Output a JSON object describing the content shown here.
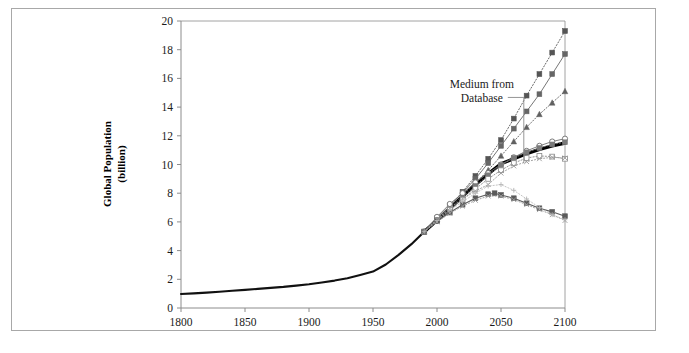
{
  "figure": {
    "background_color": "#ffffff",
    "frame_color": "#a8a8a8"
  },
  "annotation": {
    "line1": "Medium from",
    "line2": "Database"
  },
  "chart_data": {
    "type": "line",
    "title": "",
    "xlabel": "",
    "ylabel": "Global Population\n(billion)",
    "ylabel_line1": "Global Population",
    "ylabel_line2": "(billion)",
    "xlim": [
      1800,
      2100
    ],
    "ylim": [
      0,
      20
    ],
    "xticks": [
      1800,
      1850,
      1900,
      1950,
      2000,
      2050,
      2100
    ],
    "yticks": [
      0,
      2,
      4,
      6,
      8,
      10,
      12,
      14,
      16,
      18,
      20
    ],
    "xtick_labels": [
      "1800",
      "1850",
      "1900",
      "1950",
      "2000",
      "2050",
      "2100"
    ],
    "ytick_labels": [
      "0",
      "2",
      "4",
      "6",
      "8",
      "10",
      "12",
      "14",
      "16",
      "18",
      "20"
    ],
    "grid": false,
    "legend": "none",
    "annotations": [
      {
        "text": "Medium from Database",
        "x": 2035,
        "y": 15.3,
        "leader_to_x": 2046,
        "leader_to_y": 10.1
      }
    ],
    "series": [
      {
        "name": "Historical",
        "marker": "none",
        "linestyle": "solid",
        "color": "#111111",
        "width": 2.1,
        "x": [
          1800,
          1810,
          1820,
          1830,
          1840,
          1850,
          1860,
          1870,
          1880,
          1890,
          1900,
          1910,
          1920,
          1930,
          1940,
          1950,
          1960,
          1970,
          1980,
          1990
        ],
        "y": [
          0.98,
          1.02,
          1.07,
          1.13,
          1.2,
          1.26,
          1.33,
          1.4,
          1.47,
          1.56,
          1.65,
          1.78,
          1.91,
          2.07,
          2.3,
          2.54,
          3.03,
          3.7,
          4.45,
          5.32
        ]
      },
      {
        "name": "Medium from Database",
        "marker": "none",
        "linestyle": "solid",
        "color": "#000000",
        "width": 3.4,
        "x": [
          1990,
          2000,
          2010,
          2020,
          2030,
          2040,
          2050,
          2060,
          2070,
          2080,
          2090,
          2100
        ],
        "y": [
          5.32,
          6.12,
          6.93,
          7.79,
          8.6,
          9.35,
          10.05,
          10.4,
          10.75,
          11.05,
          11.3,
          11.5
        ]
      },
      {
        "name": "High scenario A (squares, dotted)",
        "marker": "square",
        "linestyle": "dotted",
        "color": "#555555",
        "width": 0.9,
        "x": [
          1990,
          2000,
          2010,
          2020,
          2030,
          2040,
          2050,
          2060,
          2070,
          2080,
          2090,
          2100
        ],
        "y": [
          5.32,
          6.2,
          7.1,
          8.1,
          9.2,
          10.4,
          11.7,
          13.2,
          14.8,
          16.3,
          17.8,
          19.3
        ]
      },
      {
        "name": "High scenario B (squares, solid)",
        "marker": "square",
        "linestyle": "solid",
        "color": "#666666",
        "width": 0.9,
        "x": [
          1990,
          2000,
          2010,
          2020,
          2030,
          2040,
          2050,
          2060,
          2070,
          2080,
          2090,
          2100
        ],
        "y": [
          5.32,
          6.25,
          7.1,
          8.05,
          9.0,
          10.1,
          11.3,
          12.5,
          13.7,
          14.9,
          16.3,
          17.7
        ]
      },
      {
        "name": "High scenario C (triangles, dotted)",
        "marker": "triangle",
        "linestyle": "dotted",
        "color": "#606060",
        "width": 0.9,
        "x": [
          1990,
          2000,
          2010,
          2020,
          2030,
          2040,
          2050,
          2060,
          2070,
          2080,
          2090,
          2100
        ],
        "y": [
          5.32,
          6.2,
          7.0,
          7.85,
          8.7,
          9.6,
          10.6,
          11.6,
          12.6,
          13.5,
          14.3,
          15.1
        ]
      },
      {
        "name": "Medium scenario D (open circles, solid)",
        "marker": "circle-open",
        "linestyle": "solid",
        "color": "#6e6e6e",
        "width": 0.9,
        "x": [
          1990,
          2000,
          2010,
          2020,
          2030,
          2040,
          2050,
          2060,
          2070,
          2080,
          2090,
          2100
        ],
        "y": [
          5.32,
          6.35,
          7.25,
          8.0,
          8.75,
          9.4,
          10.0,
          10.5,
          10.95,
          11.3,
          11.6,
          11.8
        ]
      },
      {
        "name": "Medium scenario E (squares, dotted)",
        "marker": "square",
        "linestyle": "dotted",
        "color": "#7a7a7a",
        "width": 0.9,
        "x": [
          1990,
          2000,
          2010,
          2020,
          2030,
          2040,
          2050,
          2060,
          2070,
          2080,
          2090,
          2100
        ],
        "y": [
          5.32,
          6.15,
          6.9,
          7.7,
          8.5,
          9.25,
          9.95,
          10.45,
          10.85,
          11.15,
          11.4,
          11.55
        ]
      },
      {
        "name": "Medium scenario F (open squares, dotted)",
        "marker": "square-open",
        "linestyle": "dotted",
        "color": "#888888",
        "width": 0.9,
        "x": [
          1990,
          2000,
          2010,
          2020,
          2030,
          2040,
          2050,
          2060,
          2070,
          2080,
          2090,
          2100
        ],
        "y": [
          5.32,
          6.1,
          6.85,
          7.55,
          8.3,
          9.0,
          9.6,
          10.1,
          10.45,
          10.6,
          10.55,
          10.4
        ]
      },
      {
        "name": "Low-medium scenario G (crosses, dotted)",
        "marker": "x",
        "linestyle": "dotted",
        "color": "#9a9a9a",
        "width": 0.9,
        "x": [
          1990,
          2000,
          2010,
          2020,
          2030,
          2040,
          2050,
          2060,
          2070,
          2080,
          2090,
          2100
        ],
        "y": [
          5.32,
          6.2,
          6.95,
          7.6,
          8.15,
          8.6,
          9.4,
          9.9,
          10.2,
          10.4,
          10.5,
          10.45
        ]
      },
      {
        "name": "Low scenario H (squares, solid)",
        "marker": "square",
        "linestyle": "solid",
        "color": "#5a5a5a",
        "width": 1.1,
        "x": [
          1990,
          2000,
          2010,
          2020,
          2030,
          2040,
          2045,
          2050,
          2060,
          2070,
          2080,
          2090,
          2100
        ],
        "y": [
          5.32,
          6.05,
          6.65,
          7.2,
          7.65,
          7.93,
          8.0,
          7.88,
          7.65,
          7.3,
          6.95,
          6.7,
          6.4
        ]
      },
      {
        "name": "Low scenario I (crosses, dotted)",
        "marker": "x",
        "linestyle": "dotted",
        "color": "#9a9a9a",
        "width": 0.9,
        "x": [
          1990,
          2000,
          2010,
          2020,
          2030,
          2040,
          2050,
          2060,
          2070,
          2080,
          2090,
          2100
        ],
        "y": [
          5.32,
          6.0,
          6.6,
          7.1,
          7.5,
          7.8,
          7.8,
          7.55,
          7.2,
          6.85,
          6.5,
          6.1
        ]
      },
      {
        "name": "Declining scenario J (dotted, faint)",
        "marker": "plus",
        "linestyle": "dotted",
        "color": "#b5b5b5",
        "width": 0.8,
        "x": [
          1990,
          2000,
          2010,
          2020,
          2030,
          2040,
          2050,
          2060,
          2070,
          2080,
          2090,
          2100
        ],
        "y": [
          5.32,
          6.1,
          6.8,
          7.4,
          8.0,
          8.5,
          8.6,
          8.2,
          7.6,
          7.0,
          6.5,
          6.15
        ]
      }
    ]
  }
}
